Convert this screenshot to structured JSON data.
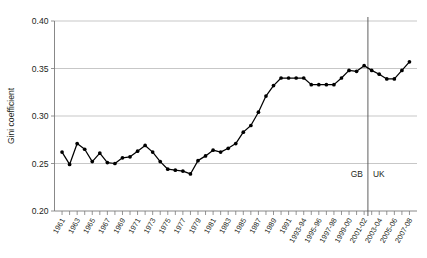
{
  "chart_data": {
    "type": "line",
    "title": "",
    "xlabel": "",
    "ylabel": "Gini coefficient",
    "ylim": [
      0.2,
      0.4
    ],
    "yticks": [
      "0.20",
      "0.25",
      "0.30",
      "0.35",
      "0.40"
    ],
    "ytick_values": [
      0.2,
      0.25,
      0.3,
      0.35,
      0.4
    ],
    "grid": true,
    "legend": false,
    "categories": [
      "1961",
      "1962",
      "1963",
      "1964",
      "1965",
      "1966",
      "1967",
      "1968",
      "1969",
      "1970",
      "1971",
      "1972",
      "1973",
      "1974",
      "1975",
      "1976",
      "1977",
      "1978",
      "1979",
      "1980",
      "1981",
      "1982",
      "1983",
      "1984",
      "1985",
      "1986",
      "1987",
      "1988",
      "1989",
      "1990",
      "1991",
      "1992",
      "1993-94",
      "1994-95",
      "1995-96",
      "1996-97",
      "1997-98",
      "1998-99",
      "1999-00",
      "2000-01",
      "2001-02",
      "2002-03",
      "2003-04",
      "2004-05",
      "2005-06",
      "2006-07",
      "2007-08"
    ],
    "xtick_labels_shown": [
      "1961",
      "1963",
      "1965",
      "1967",
      "1969",
      "1971",
      "1973",
      "1975",
      "1977",
      "1979",
      "1981",
      "1983",
      "1985",
      "1987",
      "1989",
      "1991",
      "1993-94",
      "1995-96",
      "1997-98",
      "1999-00",
      "2001-02",
      "2003-04",
      "2005-06",
      "2007-08"
    ],
    "values": [
      0.262,
      0.249,
      0.271,
      0.265,
      0.252,
      0.261,
      0.251,
      0.25,
      0.256,
      0.257,
      0.263,
      0.269,
      0.262,
      0.252,
      0.244,
      0.243,
      0.242,
      0.239,
      0.253,
      0.258,
      0.264,
      0.262,
      0.266,
      0.271,
      0.283,
      0.29,
      0.304,
      0.321,
      0.332,
      0.34,
      0.34,
      0.34,
      0.34,
      0.333,
      0.333,
      0.333,
      0.333,
      0.34,
      0.348,
      0.347,
      0.353,
      0.348,
      0.344,
      0.339,
      0.339,
      0.348,
      0.357
    ],
    "annotations": [
      {
        "name": "region-gb",
        "text": "GB",
        "side": "left"
      },
      {
        "name": "region-uk",
        "text": "UK",
        "side": "right"
      }
    ],
    "divider": {
      "after_category": "2001-02",
      "label_pair": [
        "GB",
        "UK"
      ]
    },
    "colors": {
      "series": "#000000",
      "grid": "#b9b9b9",
      "axis": "#7a7a7a",
      "divider": "#4d4d4d",
      "text": "#231f20",
      "background": "#ffffff"
    }
  }
}
